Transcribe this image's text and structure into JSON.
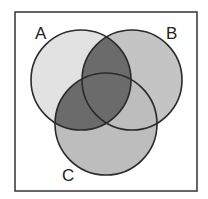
{
  "diagram": {
    "type": "venn",
    "sets": [
      {
        "id": "A",
        "label": "A",
        "cx": 81,
        "cy": 80,
        "r": 50
      },
      {
        "id": "B",
        "label": "B",
        "cx": 132,
        "cy": 80,
        "r": 50
      },
      {
        "id": "C",
        "label": "C",
        "cx": 106,
        "cy": 124,
        "r": 51
      }
    ],
    "shaded_regions": [
      "A∩B",
      "A∩C",
      "A∩B∩C"
    ],
    "colors": {
      "set_a": "#e2e2e2",
      "set_b": "#c4c4c4",
      "set_c": "#bdbdbd",
      "shaded": "#6b6b6b",
      "outline": "#2a2a2a",
      "frame": "#333333"
    }
  }
}
